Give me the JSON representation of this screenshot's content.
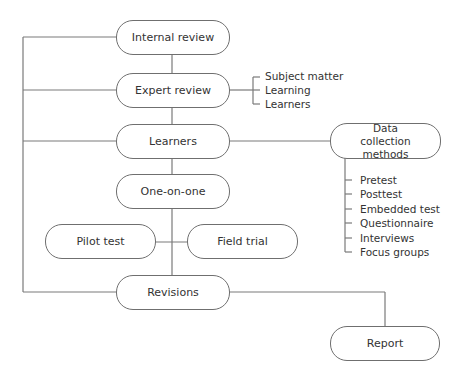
{
  "nodes": {
    "internal_review": "Internal review",
    "expert_review": "Expert review",
    "learners": "Learners",
    "one_on_one": "One-on-one",
    "pilot_test": "Pilot test",
    "field_trial": "Field trial",
    "revisions": "Revisions",
    "report": "Report",
    "data_collection": "Data collection methods"
  },
  "expert_review_aspects": [
    "Subject matter",
    "Learning",
    "Learners"
  ],
  "data_collection_methods": [
    "Pretest",
    "Posttest",
    "Embedded test",
    "Questionnaire",
    "Interviews",
    "Focus groups"
  ],
  "colors": {
    "line": "#7a7a7a",
    "text": "#333333",
    "border": "#6f6f6f"
  }
}
